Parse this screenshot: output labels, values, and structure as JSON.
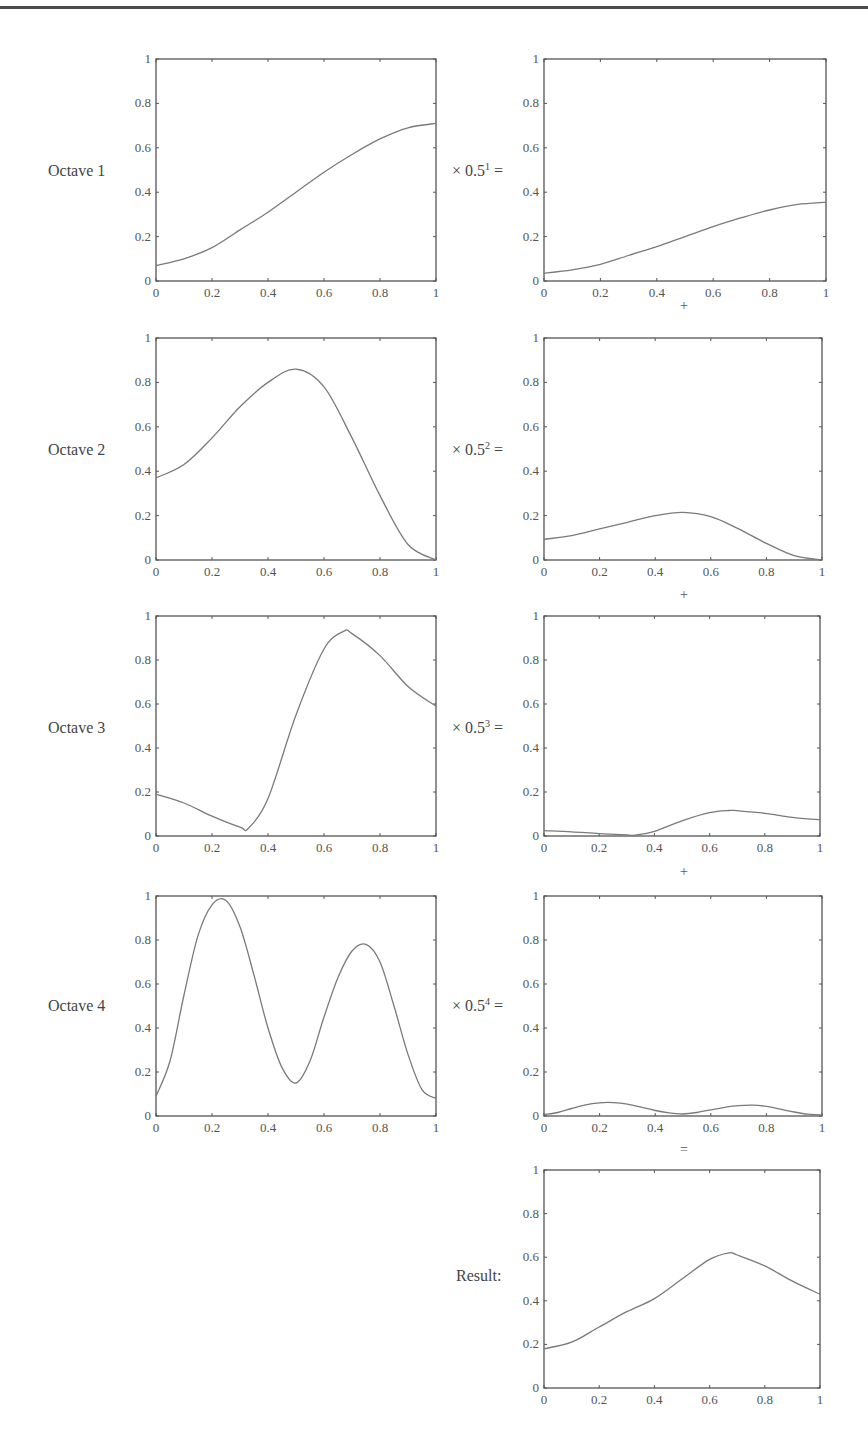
{
  "figure": {
    "rows": [
      {
        "label": "Octave 1",
        "multiplier_base": "× 0.5",
        "multiplier_exp": "1",
        "suffix": " =",
        "operator_below": "+"
      },
      {
        "label": "Octave 2",
        "multiplier_base": "× 0.5",
        "multiplier_exp": "2",
        "suffix": " =",
        "operator_below": "+"
      },
      {
        "label": "Octave 3",
        "multiplier_base": "× 0.5",
        "multiplier_exp": "3",
        "suffix": " =",
        "operator_below": "+"
      },
      {
        "label": "Octave 4",
        "multiplier_base": "× 0.5",
        "multiplier_exp": "4",
        "suffix": " =",
        "operator_below": "="
      }
    ],
    "result_label": "Result:",
    "line_color": "#7a7a7a",
    "axis_color": "#555555"
  },
  "chart_data": [
    {
      "type": "line",
      "title": "Octave 1",
      "xlabel": "",
      "ylabel": "",
      "xlim": [
        0,
        1
      ],
      "ylim": [
        0,
        1
      ],
      "xticks": [
        "0",
        "0.2",
        "0.4",
        "0.6",
        "0.8",
        "1"
      ],
      "yticks": [
        "0",
        "0.2",
        "0.4",
        "0.6",
        "0.8",
        "1"
      ],
      "grid": false,
      "x": [
        0,
        0.1,
        0.2,
        0.3,
        0.4,
        0.5,
        0.6,
        0.7,
        0.8,
        0.9,
        1.0
      ],
      "values": [
        0.07,
        0.1,
        0.15,
        0.23,
        0.31,
        0.4,
        0.49,
        0.57,
        0.64,
        0.69,
        0.71
      ]
    },
    {
      "type": "line",
      "title": "Octave 1 × 0.5^1",
      "xlim": [
        0,
        1
      ],
      "ylim": [
        0,
        1
      ],
      "xticks": [
        "0",
        "0.2",
        "0.4",
        "0.6",
        "0.8",
        "1"
      ],
      "yticks": [
        "0",
        "0.2",
        "0.4",
        "0.6",
        "0.8",
        "1"
      ],
      "grid": false,
      "x": [
        0,
        0.1,
        0.2,
        0.3,
        0.4,
        0.5,
        0.6,
        0.7,
        0.8,
        0.9,
        1.0
      ],
      "values": [
        0.035,
        0.05,
        0.075,
        0.115,
        0.155,
        0.2,
        0.245,
        0.285,
        0.32,
        0.345,
        0.355
      ]
    },
    {
      "type": "line",
      "title": "Octave 2",
      "xlim": [
        0,
        1
      ],
      "ylim": [
        0,
        1
      ],
      "xticks": [
        "0",
        "0.2",
        "0.4",
        "0.6",
        "0.8",
        "1"
      ],
      "yticks": [
        "0",
        "0.2",
        "0.4",
        "0.6",
        "0.8",
        "1"
      ],
      "grid": false,
      "x": [
        0,
        0.1,
        0.2,
        0.3,
        0.4,
        0.5,
        0.6,
        0.7,
        0.8,
        0.9,
        1.0
      ],
      "values": [
        0.37,
        0.43,
        0.55,
        0.69,
        0.8,
        0.86,
        0.78,
        0.55,
        0.29,
        0.07,
        0.0
      ]
    },
    {
      "type": "line",
      "title": "Octave 2 × 0.5^2",
      "xlim": [
        0,
        1
      ],
      "ylim": [
        0,
        1
      ],
      "xticks": [
        "0",
        "0.2",
        "0.4",
        "0.6",
        "0.8",
        "1"
      ],
      "yticks": [
        "0",
        "0.2",
        "0.4",
        "0.6",
        "0.8",
        "1"
      ],
      "grid": false,
      "x": [
        0,
        0.1,
        0.2,
        0.3,
        0.4,
        0.5,
        0.6,
        0.7,
        0.8,
        0.9,
        1.0
      ],
      "values": [
        0.093,
        0.11,
        0.14,
        0.17,
        0.2,
        0.215,
        0.195,
        0.14,
        0.075,
        0.02,
        0.0
      ]
    },
    {
      "type": "line",
      "title": "Octave 3",
      "xlim": [
        0,
        1
      ],
      "ylim": [
        0,
        1
      ],
      "xticks": [
        "0",
        "0.2",
        "0.4",
        "0.6",
        "0.8",
        "1"
      ],
      "yticks": [
        "0",
        "0.2",
        "0.4",
        "0.6",
        "0.8",
        "1"
      ],
      "grid": false,
      "x": [
        0,
        0.1,
        0.2,
        0.3,
        0.33,
        0.4,
        0.5,
        0.6,
        0.67,
        0.7,
        0.8,
        0.9,
        1.0
      ],
      "values": [
        0.19,
        0.15,
        0.09,
        0.04,
        0.035,
        0.17,
        0.55,
        0.85,
        0.93,
        0.92,
        0.82,
        0.68,
        0.59
      ]
    },
    {
      "type": "line",
      "title": "Octave 3 × 0.5^3",
      "xlim": [
        0,
        1
      ],
      "ylim": [
        0,
        1
      ],
      "xticks": [
        "0",
        "0.2",
        "0.4",
        "0.6",
        "0.8",
        "1"
      ],
      "yticks": [
        "0",
        "0.2",
        "0.4",
        "0.6",
        "0.8",
        "1"
      ],
      "grid": false,
      "x": [
        0,
        0.1,
        0.2,
        0.3,
        0.33,
        0.4,
        0.5,
        0.6,
        0.67,
        0.7,
        0.8,
        0.9,
        1.0
      ],
      "values": [
        0.024,
        0.019,
        0.011,
        0.005,
        0.004,
        0.021,
        0.069,
        0.106,
        0.116,
        0.115,
        0.103,
        0.085,
        0.074
      ]
    },
    {
      "type": "line",
      "title": "Octave 4",
      "xlim": [
        0,
        1
      ],
      "ylim": [
        0,
        1
      ],
      "xticks": [
        "0",
        "0.2",
        "0.4",
        "0.6",
        "0.8",
        "1"
      ],
      "yticks": [
        "0",
        "0.2",
        "0.4",
        "0.6",
        "0.8",
        "1"
      ],
      "grid": false,
      "x": [
        0,
        0.05,
        0.1,
        0.15,
        0.2,
        0.25,
        0.3,
        0.35,
        0.4,
        0.45,
        0.5,
        0.55,
        0.6,
        0.65,
        0.7,
        0.75,
        0.8,
        0.85,
        0.9,
        0.95,
        1.0
      ],
      "values": [
        0.09,
        0.25,
        0.55,
        0.82,
        0.96,
        0.98,
        0.86,
        0.64,
        0.4,
        0.22,
        0.15,
        0.25,
        0.45,
        0.63,
        0.75,
        0.78,
        0.7,
        0.5,
        0.28,
        0.12,
        0.08
      ]
    },
    {
      "type": "line",
      "title": "Octave 4 × 0.5^4",
      "xlim": [
        0,
        1
      ],
      "ylim": [
        0,
        1
      ],
      "xticks": [
        "0",
        "0.2",
        "0.4",
        "0.6",
        "0.8",
        "1"
      ],
      "yticks": [
        "0",
        "0.2",
        "0.4",
        "0.6",
        "0.8",
        "1"
      ],
      "grid": false,
      "x": [
        0,
        0.05,
        0.1,
        0.15,
        0.2,
        0.25,
        0.3,
        0.35,
        0.4,
        0.45,
        0.5,
        0.55,
        0.6,
        0.65,
        0.7,
        0.75,
        0.8,
        0.85,
        0.9,
        0.95,
        1.0
      ],
      "values": [
        0.006,
        0.016,
        0.034,
        0.051,
        0.06,
        0.061,
        0.054,
        0.04,
        0.025,
        0.014,
        0.009,
        0.016,
        0.028,
        0.039,
        0.047,
        0.049,
        0.044,
        0.031,
        0.018,
        0.008,
        0.005
      ]
    },
    {
      "type": "line",
      "title": "Result",
      "xlim": [
        0,
        1
      ],
      "ylim": [
        0,
        1
      ],
      "xticks": [
        "0",
        "0.2",
        "0.4",
        "0.6",
        "0.8",
        "1"
      ],
      "yticks": [
        "0",
        "0.2",
        "0.4",
        "0.6",
        "0.8",
        "1"
      ],
      "grid": false,
      "x": [
        0,
        0.1,
        0.2,
        0.3,
        0.4,
        0.5,
        0.6,
        0.67,
        0.7,
        0.8,
        0.9,
        1.0
      ],
      "values": [
        0.18,
        0.21,
        0.28,
        0.35,
        0.41,
        0.5,
        0.59,
        0.62,
        0.61,
        0.56,
        0.49,
        0.43
      ]
    }
  ]
}
